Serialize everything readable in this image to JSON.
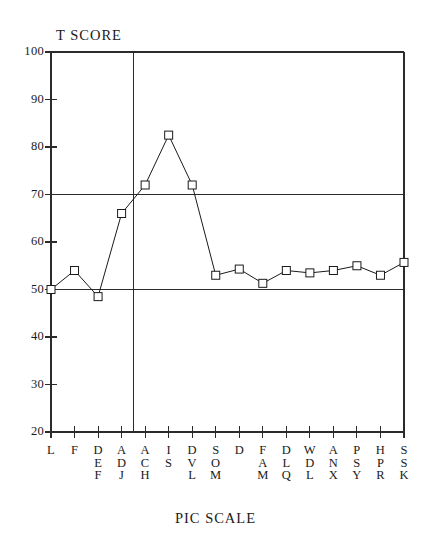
{
  "chart_data": {
    "type": "line",
    "title": "T SCORE",
    "xlabel": "PIC SCALE",
    "ylabel": "T SCORE",
    "categories": [
      "L",
      "F",
      "DEF",
      "ADJ",
      "ACH",
      "IS",
      "DVL",
      "SOM",
      "D",
      "FAM",
      "DLQ",
      "WDL",
      "ANX",
      "PSY",
      "HPR",
      "SSK"
    ],
    "category_lines": [
      [
        "L"
      ],
      [
        "F"
      ],
      [
        "D",
        "E",
        "F"
      ],
      [
        "A",
        "D",
        "J"
      ],
      [
        "A",
        "C",
        "H"
      ],
      [
        "I",
        "S"
      ],
      [
        "D",
        "V",
        "L"
      ],
      [
        "S",
        "O",
        "M"
      ],
      [
        "D"
      ],
      [
        "F",
        "A",
        "M"
      ],
      [
        "D",
        "L",
        "Q"
      ],
      [
        "W",
        "D",
        "L"
      ],
      [
        "A",
        "N",
        "X"
      ],
      [
        "P",
        "S",
        "Y"
      ],
      [
        "H",
        "P",
        "R"
      ],
      [
        "S",
        "S",
        "K"
      ]
    ],
    "values": [
      50,
      54,
      48.5,
      66,
      72,
      82.5,
      72,
      53,
      54.3,
      51.3,
      54,
      53.5,
      54,
      55,
      53,
      55.7
    ],
    "ylim": [
      20,
      100
    ],
    "ytick_labels": [
      "100",
      "90",
      "80",
      "70",
      "60",
      "50",
      "40",
      "30",
      "20"
    ],
    "ytick_values": [
      100,
      90,
      80,
      70,
      60,
      50,
      40,
      30,
      20
    ],
    "reference_lines": [
      70,
      50
    ],
    "vertical_divider_after_category": "ADJ",
    "grid": false,
    "legend": "none",
    "marker": "open-square",
    "line_color": "#1a1a1a",
    "marker_fill": "#ffffff",
    "axis_color": "#2b2b2b"
  }
}
